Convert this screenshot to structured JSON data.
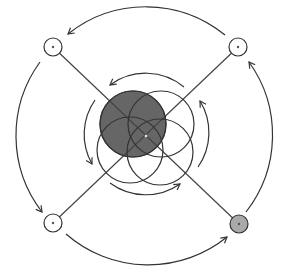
{
  "diagram": {
    "title": "",
    "type": "rotational cycle diagram",
    "colors": {
      "background": "#ffffff",
      "stroke": "#333333",
      "center_fill": "#666666",
      "corner_highlight_fill": "#a9a9a9",
      "corner_default_fill": "#ffffff"
    },
    "center": {
      "x": 146,
      "y": 136
    },
    "center_circles": [
      {
        "cx": 133,
        "cy": 124,
        "r": 33,
        "filled": true
      },
      {
        "cx": 161,
        "cy": 124,
        "r": 33,
        "filled": false
      },
      {
        "cx": 130,
        "cy": 150,
        "r": 33,
        "filled": false
      },
      {
        "cx": 160,
        "cy": 152,
        "r": 33,
        "filled": false
      }
    ],
    "corner_nodes": [
      {
        "id": "top-left",
        "cx": 53,
        "cy": 47,
        "r": 9,
        "filled": false
      },
      {
        "id": "top-right",
        "cx": 238,
        "cy": 47,
        "r": 9,
        "filled": false
      },
      {
        "id": "bottom-left",
        "cx": 53,
        "cy": 223,
        "r": 9,
        "filled": false
      },
      {
        "id": "bottom-right",
        "cx": 239,
        "cy": 224,
        "r": 9,
        "filled": true
      }
    ],
    "diagonals": [
      {
        "from": "top-left",
        "to": "bottom-right"
      },
      {
        "from": "top-right",
        "to": "bottom-left"
      }
    ],
    "inner_arrows": [
      {
        "position": "top",
        "direction": "counterclockwise",
        "arrowhead": "left"
      },
      {
        "position": "left",
        "direction": "counterclockwise",
        "arrowhead": "down"
      },
      {
        "position": "bottom",
        "direction": "counterclockwise",
        "arrowhead": "right"
      },
      {
        "position": "right",
        "direction": "counterclockwise",
        "arrowhead": "up"
      }
    ],
    "outer_arrows": [
      {
        "position": "top",
        "direction": "counterclockwise",
        "arrowhead": "left"
      },
      {
        "position": "left",
        "direction": "counterclockwise",
        "arrowhead": "down"
      },
      {
        "position": "bottom",
        "direction": "counterclockwise",
        "arrowhead": "right"
      },
      {
        "position": "right",
        "direction": "counterclockwise",
        "arrowhead": "up"
      }
    ]
  }
}
